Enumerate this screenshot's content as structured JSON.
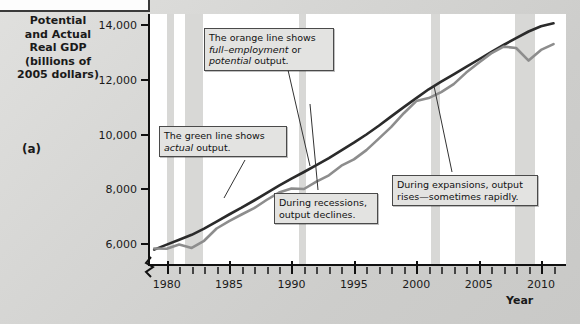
{
  "panel": {
    "label": "(a)"
  },
  "axis_title": "Potential and Actual Real GDP (billions of 2005 dollars)",
  "xaxis_name": "Year",
  "callouts": {
    "orange": {
      "line1": "The orange line shows",
      "line2a": "full–employment",
      "line2b": " or",
      "line3a": "potential",
      "line3b": " output."
    },
    "green": {
      "line1": "The green line shows",
      "line2a": "actual",
      "line2b": " output."
    },
    "recession": {
      "line1": "During recessions,",
      "line2": "output declines."
    },
    "expansion": {
      "line1": "During expansions, output",
      "line2": "rises—sometimes rapidly."
    }
  },
  "chart_data": {
    "type": "line",
    "xlabel": "Year",
    "ylabel": "Potential and Actual Real GDP (billions of 2005 dollars)",
    "xlim": [
      1978.5,
      2012
    ],
    "ylim": [
      5200,
      14400
    ],
    "yticks": [
      6000,
      8000,
      10000,
      12000,
      14000
    ],
    "ytick_labels": [
      "6,000",
      "8,000",
      "10,000",
      "12,000",
      "14,000"
    ],
    "xticks_major": [
      1980,
      1985,
      1990,
      1995,
      2000,
      2005,
      2010
    ],
    "xtick_labels": [
      "1980",
      "1985",
      "1990",
      "1995",
      "2000",
      "2005",
      "2010"
    ],
    "xticks_minor": [
      1981,
      1982,
      1983,
      1984,
      1986,
      1987,
      1988,
      1989,
      1991,
      1992,
      1993,
      1994,
      1996,
      1997,
      1998,
      1999,
      2001,
      2002,
      2003,
      2004,
      2006,
      2007,
      2008,
      2009,
      2011
    ],
    "grid": false,
    "y_axis_break": true,
    "legend_position": "none",
    "recession_bands": [
      {
        "start": 1980.0,
        "end": 1980.6
      },
      {
        "start": 1981.5,
        "end": 1982.9
      },
      {
        "start": 1990.6,
        "end": 1991.2
      },
      {
        "start": 2001.2,
        "end": 2001.9
      },
      {
        "start": 2007.9,
        "end": 2009.5
      }
    ],
    "x": [
      1979,
      1980,
      1981,
      1982,
      1983,
      1984,
      1985,
      1986,
      1987,
      1988,
      1989,
      1990,
      1991,
      1992,
      1993,
      1994,
      1995,
      1996,
      1997,
      1998,
      1999,
      2000,
      2001,
      2002,
      2003,
      2004,
      2005,
      2006,
      2007,
      2008,
      2009,
      2010,
      2011
    ],
    "series": [
      {
        "name": "potential output",
        "color": "#e08a2e",
        "values": [
          5800,
          5980,
          6160,
          6340,
          6560,
          6820,
          7080,
          7330,
          7590,
          7860,
          8130,
          8390,
          8630,
          8880,
          9140,
          9420,
          9700,
          10000,
          10320,
          10660,
          11000,
          11330,
          11650,
          11930,
          12200,
          12470,
          12740,
          13010,
          13270,
          13520,
          13760,
          13950,
          14060
        ]
      },
      {
        "name": "actual output",
        "color": "#4f8f4a",
        "values": [
          5840,
          5830,
          5980,
          5860,
          6120,
          6570,
          6840,
          7080,
          7310,
          7610,
          7880,
          8030,
          8010,
          8280,
          8510,
          8860,
          9090,
          9430,
          9850,
          10280,
          10780,
          11220,
          11330,
          11550,
          11840,
          12260,
          12620,
          12960,
          13210,
          13160,
          12700,
          13090,
          13300
        ]
      }
    ],
    "annotations": [
      "The orange line shows full–employment or potential output.",
      "The green line shows actual output.",
      "During recessions, output declines.",
      "During expansions, output rises—sometimes rapidly."
    ]
  }
}
